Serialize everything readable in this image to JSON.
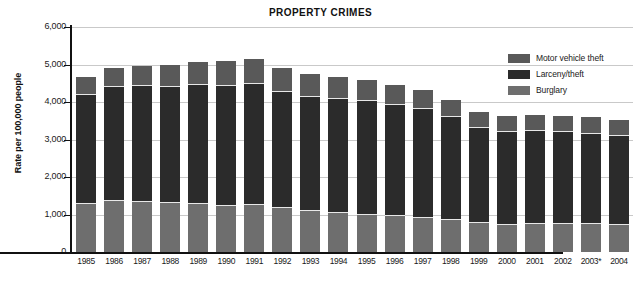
{
  "chart_data": {
    "type": "bar",
    "subtype": "stacked-bar",
    "title": "PROPERTY CRIMES",
    "xlabel": "",
    "ylabel": "Rate per 100,000 people",
    "ylim": [
      0,
      6000
    ],
    "yticks": [
      0,
      1000,
      2000,
      3000,
      4000,
      5000,
      6000
    ],
    "ytick_labels": [
      "0",
      "1,000",
      "2,000",
      "3,000",
      "4,000",
      "5,000",
      "6,000"
    ],
    "grid": true,
    "legend_position": "top-right",
    "categories": [
      "1985",
      "1986",
      "1987",
      "1988",
      "1989",
      "1990",
      "1991",
      "1992",
      "1993",
      "1994",
      "1995",
      "1996",
      "1997",
      "1998",
      "1999",
      "2000",
      "2001",
      "2002",
      "2003*",
      "2004"
    ],
    "series": [
      {
        "name": "Burglary",
        "color": "#6e6e6e",
        "values": [
          1290,
          1350,
          1340,
          1320,
          1280,
          1240,
          1250,
          1170,
          1100,
          1050,
          990,
          950,
          920,
          860,
          770,
          730,
          740,
          750,
          740,
          730
        ]
      },
      {
        "name": "Larceny/theft",
        "color": "#2b2b2b",
        "values": [
          2910,
          3050,
          3100,
          3090,
          3170,
          3190,
          3240,
          3100,
          3030,
          3030,
          3040,
          2980,
          2890,
          2730,
          2550,
          2480,
          2490,
          2450,
          2420,
          2360
        ]
      },
      {
        "name": "Motor vehicle theft",
        "color": "#595959",
        "values": [
          460,
          510,
          530,
          590,
          630,
          660,
          660,
          630,
          610,
          590,
          560,
          530,
          510,
          460,
          420,
          410,
          430,
          430,
          430,
          420
        ]
      }
    ],
    "totals": [
      4660,
      4910,
      4970,
      5000,
      5080,
      5090,
      5150,
      4900,
      4740,
      4670,
      4590,
      4460,
      4320,
      4050,
      3740,
      3620,
      3660,
      3630,
      3590,
      3510
    ],
    "footnote_marker": "*"
  },
  "legend": {
    "items": [
      {
        "label": "Motor vehicle theft",
        "color": "#595959"
      },
      {
        "label": "Larceny/theft",
        "color": "#2b2b2b"
      },
      {
        "label": "Burglary",
        "color": "#6e6e6e"
      }
    ]
  }
}
